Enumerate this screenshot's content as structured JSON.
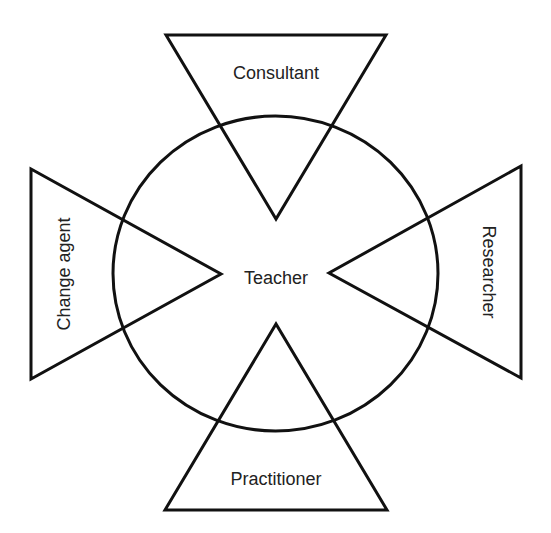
{
  "diagram": {
    "title": "",
    "colors": {
      "stroke": "#111111",
      "text": "#222222",
      "background": "#ffffff"
    },
    "center": {
      "shape": "circle",
      "label": "Teacher"
    },
    "roles": [
      {
        "id": "top",
        "shape": "triangle",
        "points_toward": "center",
        "label": "Consultant"
      },
      {
        "id": "left",
        "shape": "triangle",
        "points_toward": "center",
        "label": "Change agent"
      },
      {
        "id": "right",
        "shape": "triangle",
        "points_toward": "center",
        "label": "Researcher"
      },
      {
        "id": "bottom",
        "shape": "triangle",
        "points_toward": "center",
        "label": "Practitioner"
      }
    ]
  }
}
